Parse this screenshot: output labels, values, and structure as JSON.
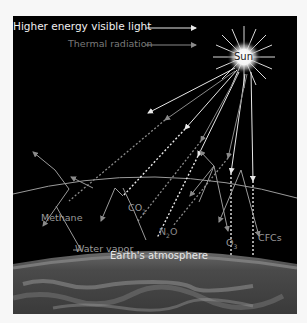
{
  "legend": {
    "visible_light": "Higher energy visible light",
    "thermal": "Thermal radiation"
  },
  "sun": {
    "label": "Sun"
  },
  "gases": {
    "methane": "Methane",
    "co2": "CO",
    "co2_sub": "2",
    "water": "Water vapor",
    "n2o_a": "N",
    "n2o_sub": "2",
    "n2o_b": "O",
    "o3": "O",
    "o3_sub": "3",
    "cfcs": "CFCs"
  },
  "atmosphere": {
    "label": "Earth's atmosphere"
  },
  "colors": {
    "background": "#000000",
    "visible_light": "#e8e8e8",
    "thermal": "#8a8a8a",
    "atmosphere_line": "#9a9a9a"
  }
}
